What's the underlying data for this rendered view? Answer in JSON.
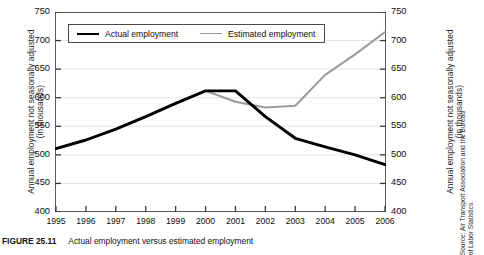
{
  "figure": {
    "number_label": "FIGURE 25.11",
    "caption": "Actual employment versus estimated employment",
    "left_axis_title_line1": "Annual employment not seasonally adjusted",
    "left_axis_title_line2": "(in thousands)",
    "right_axis_title_line1": "Annual employment not seasonally adjusted",
    "right_axis_title_line2": "(in thousands)",
    "source_note": "Source: Air Transport Association and the Bureau of Labor Statistics."
  },
  "legend": {
    "items": [
      {
        "label": "Actual employment",
        "color": "#000000",
        "style": "actual"
      },
      {
        "label": "Estimated employment",
        "color": "#9b9b9b",
        "style": "estimated"
      }
    ]
  },
  "colors": {
    "actual_line": "#000000",
    "estimated_line": "#9b9b9b",
    "gridline": "#e4e4e4",
    "frame": "#5c5c5c",
    "text": "#0d0d0d"
  },
  "chart_data": {
    "type": "line",
    "title": "Actual employment versus estimated employment",
    "xlabel": "",
    "ylabel": "Annual employment not seasonally adjusted (in thousands)",
    "xlim": [
      1995,
      2006
    ],
    "ylim": [
      400,
      750
    ],
    "ytick_values": [
      400,
      450,
      500,
      550,
      600,
      650,
      700,
      750
    ],
    "ytick_labels": [
      "400",
      "450",
      "500",
      "550",
      "600",
      "650",
      "700",
      "750"
    ],
    "right_ytick_labels": [
      "400",
      "450",
      "500",
      "550",
      "600",
      "650",
      "700",
      "750"
    ],
    "grid": true,
    "legend_position": "top-left-inside",
    "categories": [
      1995,
      1996,
      1997,
      1998,
      1999,
      2000,
      2001,
      2002,
      2003,
      2004,
      2005,
      2006
    ],
    "xtick_labels": [
      "1995",
      "1996",
      "1997",
      "1998",
      "1999",
      "2000",
      "2001",
      "2002",
      "2003",
      "2004",
      "2005",
      "2006"
    ],
    "series": [
      {
        "name": "Actual employment",
        "color": "#000000",
        "values": [
          511,
          526,
          545,
          567,
          590,
          612,
          612,
          567,
          529,
          514,
          500,
          483
        ]
      },
      {
        "name": "Estimated employment",
        "color": "#9b9b9b",
        "values": [
          511,
          526,
          545,
          567,
          590,
          612,
          593,
          583,
          586,
          640,
          676,
          715
        ]
      }
    ]
  }
}
